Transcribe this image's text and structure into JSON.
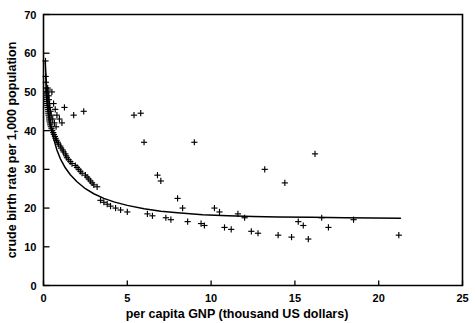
{
  "chart_data": {
    "type": "scatter",
    "title": "",
    "xlabel": "per capita GNP (thousand US dollars)",
    "ylabel": "crude birth rate per 1,000 population",
    "xlim": [
      0,
      25
    ],
    "ylim": [
      0,
      70
    ],
    "xticks": [
      0,
      5,
      10,
      15,
      20,
      25
    ],
    "yticks": [
      0,
      10,
      20,
      30,
      40,
      50,
      60,
      70
    ],
    "xticklabels": [
      "0",
      "5",
      "10",
      "15",
      "20",
      "25"
    ],
    "yticklabels": [
      "0",
      "10",
      "20",
      "30",
      "40",
      "50",
      "60",
      "70"
    ],
    "grid": false,
    "legend": null,
    "marker": "plus",
    "series": [
      {
        "name": "countries",
        "x": [
          0.12,
          0.13,
          0.14,
          0.15,
          0.16,
          0.17,
          0.18,
          0.19,
          0.2,
          0.21,
          0.22,
          0.23,
          0.24,
          0.25,
          0.26,
          0.27,
          0.28,
          0.29,
          0.3,
          0.31,
          0.32,
          0.33,
          0.34,
          0.35,
          0.36,
          0.37,
          0.38,
          0.4,
          0.42,
          0.44,
          0.46,
          0.48,
          0.5,
          0.52,
          0.55,
          0.58,
          0.6,
          0.62,
          0.65,
          0.68,
          0.7,
          0.72,
          0.75,
          0.78,
          0.8,
          0.85,
          0.9,
          0.95,
          1.0,
          1.05,
          1.1,
          1.15,
          1.2,
          1.25,
          1.3,
          1.35,
          1.4,
          1.5,
          1.6,
          1.7,
          1.8,
          1.9,
          2.0,
          2.1,
          2.2,
          2.3,
          2.4,
          2.5,
          2.6,
          2.7,
          2.8,
          2.9,
          3.0,
          3.2,
          3.4,
          3.6,
          3.8,
          4.0,
          4.3,
          4.6,
          5.0,
          5.4,
          5.8,
          6.0,
          6.2,
          6.5,
          6.8,
          7.0,
          7.3,
          7.6,
          8.0,
          8.3,
          8.6,
          9.0,
          9.4,
          9.6,
          10.2,
          10.5,
          10.8,
          11.2,
          11.6,
          12.0,
          12.4,
          12.8,
          13.2,
          14.0,
          14.4,
          14.8,
          15.2,
          15.5,
          15.8,
          16.2,
          16.6,
          17.0,
          18.5,
          21.2
        ],
        "y": [
          58.0,
          54.0,
          52.5,
          51.0,
          50.0,
          49.5,
          49.0,
          48.5,
          48.0,
          47.5,
          47.0,
          46.5,
          46.0,
          51.0,
          50.5,
          45.5,
          45.0,
          44.5,
          44.0,
          49.0,
          48.0,
          43.5,
          43.0,
          42.5,
          47.0,
          46.0,
          42.0,
          41.5,
          45.0,
          41.0,
          44.0,
          40.5,
          50.0,
          40.0,
          43.0,
          39.5,
          47.0,
          39.0,
          42.0,
          38.5,
          45.5,
          38.0,
          41.0,
          37.5,
          44.0,
          37.0,
          36.5,
          43.0,
          36.0,
          35.5,
          42.0,
          35.0,
          34.5,
          46.0,
          34.0,
          33.5,
          33.0,
          32.5,
          32.0,
          31.5,
          44.0,
          31.0,
          30.5,
          30.0,
          29.5,
          29.0,
          45.0,
          28.5,
          28.0,
          27.5,
          27.0,
          26.5,
          26.0,
          25.5,
          22.0,
          21.5,
          21.0,
          20.5,
          20.0,
          19.5,
          19.0,
          44.0,
          44.5,
          37.0,
          18.5,
          18.0,
          28.5,
          27.0,
          17.5,
          17.0,
          22.5,
          20.0,
          16.5,
          37.0,
          16.0,
          15.5,
          20.0,
          19.0,
          15.0,
          14.5,
          18.5,
          17.5,
          14.0,
          13.5,
          30.0,
          13.0,
          26.5,
          12.5,
          16.5,
          15.5,
          12.0,
          34.0,
          17.5,
          15.0,
          17.0,
          13.0
        ]
      }
    ],
    "fit_curve": {
      "name": "fitted curve",
      "x": [
        0.1,
        0.2,
        0.3,
        0.45,
        0.6,
        0.8,
        1.0,
        1.3,
        1.6,
        2.0,
        2.5,
        3.0,
        3.6,
        4.2,
        5.0,
        6.0,
        7.0,
        8.0,
        9.5,
        11.0,
        12.5,
        14.0,
        16.0,
        18.0,
        21.3
      ],
      "y": [
        58.0,
        50.0,
        45.5,
        41.0,
        38.0,
        35.0,
        32.8,
        30.4,
        28.6,
        26.8,
        25.0,
        23.7,
        22.5,
        21.6,
        20.7,
        19.8,
        19.2,
        18.8,
        18.3,
        18.0,
        17.8,
        17.7,
        17.6,
        17.5,
        17.4
      ]
    }
  },
  "figure": {
    "xlabel_text": "per capita GNP (thousand US dollars)",
    "ylabel_text": "crude birth rate per 1,000 population"
  }
}
